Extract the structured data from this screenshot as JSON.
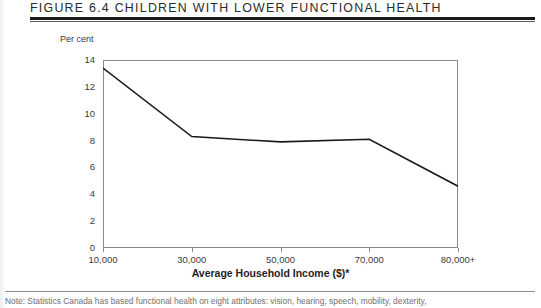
{
  "figure": {
    "title": "Figure 6.4 Children with Lower Functional Health",
    "note": "Note: Statistics Canada has based functional health on eight attributes: vision, hearing, speech, mobility, dexterity,"
  },
  "chart_data": {
    "type": "line",
    "title": "Figure 6.4 Children with Lower Functional Health",
    "xlabel": "Average Household Income ($)*",
    "ylabel": "Per cent",
    "categories": [
      "10,000",
      "30,000",
      "50,000",
      "70,000",
      "80,000+"
    ],
    "x": [
      10000,
      30000,
      50000,
      70000,
      80000
    ],
    "values": [
      13.4,
      8.3,
      7.9,
      8.1,
      4.6
    ],
    "series": [
      {
        "name": "Children with lower functional health",
        "values": [
          13.4,
          8.3,
          7.9,
          8.1,
          4.6
        ],
        "color": "#1a1a1a"
      }
    ],
    "ylim": [
      0,
      14
    ],
    "yticks": [
      0,
      2,
      4,
      6,
      8,
      10,
      12,
      14
    ],
    "ytick_labels": [
      "0",
      "2",
      "4",
      "6",
      "8",
      "10",
      "12",
      "14"
    ],
    "xtick_labels": [
      "10,000",
      "30,000",
      "50,000",
      "70,000",
      "80,000+"
    ],
    "grid": false,
    "legend": "none",
    "line_color": "#1a1a1a",
    "axis_color": "#8a8a8a"
  }
}
